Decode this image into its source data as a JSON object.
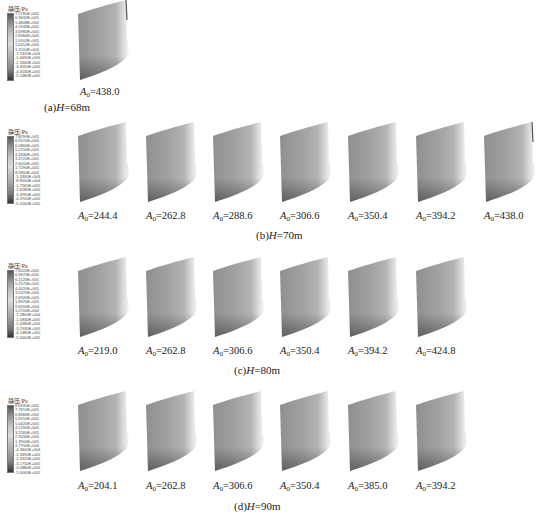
{
  "figure": {
    "legend_title": "静压/Pa",
    "panels": [
      {
        "id": "a",
        "caption_prefix": "(a)",
        "caption_var": "H",
        "caption_value": "=68m",
        "legend_values": [
          "7.2780E+005",
          "6.3632E+005",
          "5.4808E+005",
          "4.5946E+005",
          "3.6980E+005",
          "2.8060E+005",
          "1.9102E+005",
          "1.0152E+005",
          "1.2010E+004",
          "-7.7420E+004",
          "-1.6690E+005",
          "-2.5640E+005",
          "-3.4550E+005",
          "-4.3530E+005",
          "-5.2480E+005"
        ],
        "blades": [
          {
            "var": "A",
            "sub": "0",
            "value": "=438.0"
          }
        ]
      },
      {
        "id": "b",
        "caption_prefix": "(b)",
        "caption_var": "H",
        "caption_value": "=70m",
        "legend_values": [
          "7.8290E+005",
          "6.9570E+005",
          "6.0860E+005",
          "5.2150E+005",
          "4.3430E+005",
          "3.4720E+005",
          "2.6010E+005",
          "1.7290E+005",
          "8.5800E+004",
          "-1.3300E+003",
          "-8.8500E+004",
          "-1.7560E+005",
          "-2.6280E+005",
          "-3.4990E+005",
          "-4.3700E+005",
          "-5.2000E+005"
        ],
        "blades": [
          {
            "var": "A",
            "sub": "0",
            "value": "=244.4"
          },
          {
            "var": "A",
            "sub": "0",
            "value": "=262.8"
          },
          {
            "var": "A",
            "sub": "0",
            "value": "=288.6"
          },
          {
            "var": "A",
            "sub": "0",
            "value": "=306.6"
          },
          {
            "var": "A",
            "sub": "0",
            "value": "=350.4"
          },
          {
            "var": "A",
            "sub": "0",
            "value": "=394.2"
          },
          {
            "var": "A",
            "sub": "0",
            "value": "=438.0"
          }
        ]
      },
      {
        "id": "c",
        "caption_prefix": "(c)",
        "caption_var": "H",
        "caption_value": "=80m",
        "legend_values": [
          "7.8220E+005",
          "6.9670E+005",
          "6.1120E+005",
          "5.2570E+005",
          "4.4020E+005",
          "3.5470E+005",
          "2.6920E+005",
          "1.8370E+005",
          "9.8200E+004",
          "1.2700E+004",
          "-7.2800E+004",
          "-1.5830E+005",
          "-2.4380E+005",
          "-3.2930E+005",
          "-4.1480E+005",
          "-5.0000E+005"
        ],
        "blades": [
          {
            "var": "A",
            "sub": "0",
            "value": "=219.0"
          },
          {
            "var": "A",
            "sub": "0",
            "value": "=262.8"
          },
          {
            "var": "A",
            "sub": "0",
            "value": "=306.6"
          },
          {
            "var": "A",
            "sub": "0",
            "value": "=350.4"
          },
          {
            "var": "A",
            "sub": "0",
            "value": "=394.2"
          },
          {
            "var": "A",
            "sub": "0",
            "value": "=424.8"
          }
        ]
      },
      {
        "id": "d",
        "caption_prefix": "(d)",
        "caption_var": "H",
        "caption_value": "=90m",
        "legend_values": [
          "8.6940E+005",
          "7.7810E+005",
          "6.8680E+005",
          "5.9550E+005",
          "5.0420E+005",
          "4.1290E+005",
          "3.2160E+005",
          "2.3030E+005",
          "1.3900E+005",
          "4.7700E+004",
          "-4.3600E+004",
          "-1.3490E+005",
          "-2.2620E+005",
          "-3.1750E+005",
          "-4.0880E+005",
          "-5.0000E+005"
        ],
        "blades": [
          {
            "var": "A",
            "sub": "0",
            "value": "=204.1"
          },
          {
            "var": "A",
            "sub": "0",
            "value": "=262.8"
          },
          {
            "var": "A",
            "sub": "0",
            "value": "=306.6"
          },
          {
            "var": "A",
            "sub": "0",
            "value": "=350.4"
          },
          {
            "var": "A",
            "sub": "0",
            "value": "=385.0"
          },
          {
            "var": "A",
            "sub": "0",
            "value": "=394.2"
          }
        ]
      }
    ]
  }
}
